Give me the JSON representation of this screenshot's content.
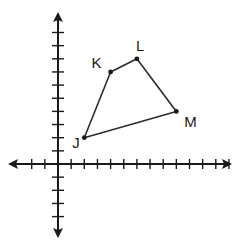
{
  "diagram": {
    "type": "coordinate-plane-polygon",
    "x_axis": {
      "min_tick": -2,
      "max_tick": 13
    },
    "y_axis": {
      "min_tick": -4,
      "max_tick": 10
    },
    "polygon_order": [
      "J",
      "K",
      "L",
      "M"
    ],
    "vertices": [
      {
        "label": "J",
        "x": 2,
        "y": 2
      },
      {
        "label": "K",
        "x": 4,
        "y": 7
      },
      {
        "label": "L",
        "x": 6,
        "y": 8
      },
      {
        "label": "M",
        "x": 9,
        "y": 4
      }
    ]
  }
}
